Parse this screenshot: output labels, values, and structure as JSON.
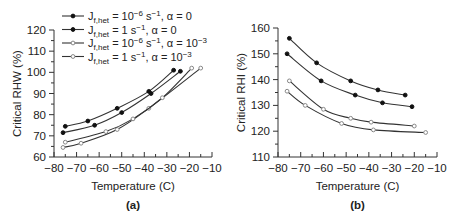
{
  "chart_data": [
    {
      "type": "line",
      "panel_label": "(a)",
      "title": "",
      "xlabel": "Temperature (C)",
      "ylabel": "Critical RHW (%)",
      "xlim": [
        -80,
        -10
      ],
      "ylim": [
        60,
        120
      ],
      "xticks": [
        -80,
        -70,
        -60,
        -50,
        -40,
        -30,
        -20,
        -10
      ],
      "yticks": [
        60,
        70,
        80,
        90,
        100,
        110,
        120
      ],
      "grid": false,
      "legend_position": "upper left",
      "series": [
        {
          "name": "J_f,het = 10^-6 s^-1, α = 0",
          "marker": "filled-circle",
          "x": [
            -76,
            -62,
            -50,
            -37,
            -24
          ],
          "values": [
            71.5,
            75,
            81,
            90,
            100.5
          ]
        },
        {
          "name": "J_f,het = 1 s^-1, α = 0",
          "marker": "filled-star",
          "x": [
            -75,
            -65,
            -52,
            -38,
            -27
          ],
          "values": [
            74.5,
            77,
            83,
            91,
            101
          ]
        },
        {
          "name": "J_f,het = 10^-6 s^-1, α = 10^-3",
          "marker": "open-circle",
          "x": [
            -76,
            -68,
            -52,
            -38,
            -15
          ],
          "values": [
            64.5,
            66.5,
            73,
            83,
            102
          ]
        },
        {
          "name": "J_f,het = 1 s^-1, α = 10^-3",
          "marker": "open-star",
          "x": [
            -75,
            -57,
            -45,
            -32,
            -19
          ],
          "values": [
            67,
            72,
            78,
            88,
            102
          ]
        }
      ]
    },
    {
      "type": "line",
      "panel_label": "(b)",
      "title": "",
      "xlabel": "Temperature (C)",
      "ylabel": "Critical RHI (%)",
      "xlim": [
        -80,
        -10
      ],
      "ylim": [
        110,
        160
      ],
      "xticks": [
        -80,
        -70,
        -60,
        -50,
        -40,
        -30,
        -20,
        -10
      ],
      "yticks": [
        110,
        120,
        130,
        140,
        150,
        160
      ],
      "grid": false,
      "series": [
        {
          "name": "J_f,het = 10^-6 s^-1, α = 0",
          "marker": "filled-circle",
          "x": [
            -76,
            -61,
            -46,
            -34,
            -21
          ],
          "values": [
            150,
            139.5,
            134,
            131,
            129.5
          ]
        },
        {
          "name": "J_f,het = 1 s^-1, α = 0",
          "marker": "filled-star",
          "x": [
            -75,
            -63,
            -48,
            -36,
            -24
          ],
          "values": [
            156,
            146.5,
            139.5,
            136,
            134
          ]
        },
        {
          "name": "J_f,het = 10^-6 s^-1, α = 10^-3",
          "marker": "open-circle",
          "x": [
            -76,
            -68,
            -52,
            -38,
            -15
          ],
          "values": [
            135.5,
            130,
            123,
            120.5,
            119.5
          ]
        },
        {
          "name": "J_f,het = 1 s^-1, α = 10^-3",
          "marker": "open-star",
          "x": [
            -75,
            -60,
            -48,
            -39,
            -20
          ],
          "values": [
            139.5,
            128.5,
            125,
            123.5,
            122
          ]
        }
      ]
    }
  ],
  "legend": [
    {
      "prefix": "J",
      "sub": "f,het",
      "mid": " = 10",
      "sup": "−6",
      "post": " s",
      "post_sup": "−1",
      "alpha": ", α = 0",
      "alpha_sup": ""
    },
    {
      "prefix": "J",
      "sub": "f,het",
      "mid": " = 1",
      "sup": "",
      "post": " s",
      "post_sup": "−1",
      "alpha": ", α = 0",
      "alpha_sup": ""
    },
    {
      "prefix": "J",
      "sub": "f,het",
      "mid": " = 10",
      "sup": "−6",
      "post": " s",
      "post_sup": "−1",
      "alpha": ", α = 10",
      "alpha_sup": "−3"
    },
    {
      "prefix": "J",
      "sub": "f,het",
      "mid": " = 1",
      "sup": "",
      "post": " s",
      "post_sup": "−1",
      "alpha": ", α = 10",
      "alpha_sup": "−3"
    }
  ],
  "colors": {
    "line": "#333333",
    "filled_marker": "#111111",
    "open_marker": "#888888",
    "axis": "#333333"
  }
}
